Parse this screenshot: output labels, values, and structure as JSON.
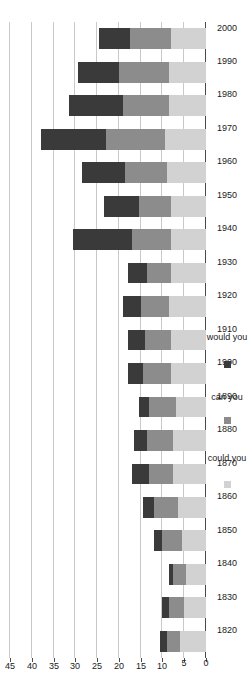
{
  "chart_data": {
    "type": "bar",
    "orientation": "horizontal-rotated",
    "stacked": true,
    "title": "",
    "xlabel": "",
    "ylabel": "",
    "categories": [
      "1820",
      "1830",
      "1840",
      "1850",
      "1860",
      "1870",
      "1880",
      "1890",
      "1900",
      "1910",
      "1920",
      "1930",
      "1940",
      "1950",
      "1960",
      "1970",
      "1980",
      "1990",
      "2000"
    ],
    "series": [
      {
        "name": "could you",
        "color": "#d2d2d2",
        "values": [
          6.0,
          5.0,
          4.5,
          5.5,
          6.5,
          7.5,
          7.5,
          7.0,
          8.0,
          8.0,
          8.5,
          8.0,
          8.0,
          8.0,
          9.0,
          9.5,
          8.5,
          8.5,
          8.0
        ]
      },
      {
        "name": "can you",
        "color": "#8c8c8c",
        "values": [
          3.0,
          3.5,
          3.0,
          4.5,
          5.5,
          5.5,
          6.0,
          6.0,
          6.5,
          6.0,
          6.5,
          5.5,
          9.0,
          7.5,
          9.5,
          13.5,
          10.5,
          11.5,
          9.5
        ]
      },
      {
        "name": "would you",
        "color": "#3a3a3a",
        "values": [
          1.5,
          1.5,
          1.0,
          2.0,
          2.5,
          4.0,
          3.0,
          2.5,
          3.5,
          4.0,
          4.0,
          4.5,
          13.5,
          8.0,
          10.0,
          15.0,
          12.5,
          9.5,
          7.0
        ]
      }
    ],
    "totals": [
      10.5,
      10.0,
      8.5,
      12.0,
      14.5,
      17.0,
      16.5,
      15.5,
      18.0,
      18.0,
      19.0,
      18.0,
      30.5,
      23.5,
      28.5,
      38.0,
      31.5,
      29.5,
      24.5
    ],
    "xlim": [
      0,
      45
    ],
    "ticks": [
      0,
      5,
      10,
      15,
      20,
      25,
      30,
      35,
      40,
      45
    ],
    "tick_labels": [
      "0",
      "5",
      "10",
      "15",
      "20",
      "25",
      "30",
      "35",
      "40",
      "45"
    ],
    "grid": true,
    "legend_position": "bottom-right",
    "legend": [
      {
        "label": "could you",
        "color": "#d2d2d2"
      },
      {
        "label": "can you",
        "color": "#8c8c8c"
      },
      {
        "label": "would you",
        "color": "#3a3a3a"
      }
    ]
  },
  "axes": {
    "category_axis_name": "year-axis",
    "value_axis_name": "value-axis"
  }
}
